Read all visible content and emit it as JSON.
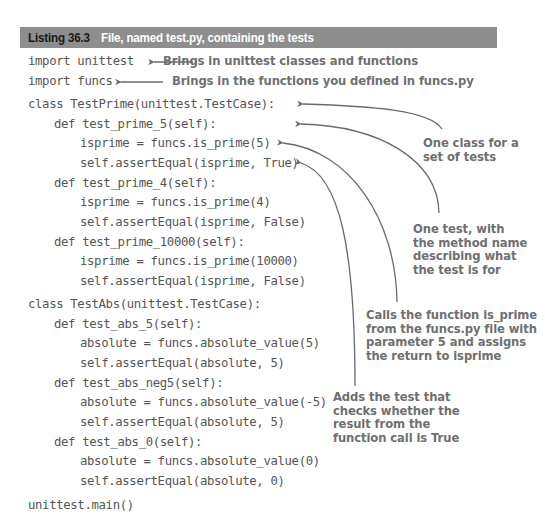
{
  "listing": {
    "number": "Listing 36.3",
    "title": "File, named test.py, containing the tests"
  },
  "code": {
    "lines": [
      {
        "indent": 0,
        "text": "import unittest"
      },
      {
        "indent": 0,
        "text": "import funcs"
      },
      {
        "indent": 0,
        "text": "class TestPrime(unittest.TestCase):"
      },
      {
        "indent": 1,
        "text": "def test_prime_5(self):"
      },
      {
        "indent": 2,
        "text": "isprime = funcs.is_prime(5)"
      },
      {
        "indent": 2,
        "text": "self.assertEqual(isprime, True)"
      },
      {
        "indent": 1,
        "text": "def test_prime_4(self):"
      },
      {
        "indent": 2,
        "text": "isprime = funcs.is_prime(4)"
      },
      {
        "indent": 2,
        "text": "self.assertEqual(isprime, False)"
      },
      {
        "indent": 1,
        "text": "def test_prime_10000(self):"
      },
      {
        "indent": 2,
        "text": "isprime = funcs.is_prime(10000)"
      },
      {
        "indent": 2,
        "text": "self.assertEqual(isprime, False)"
      },
      {
        "indent": 0,
        "text": "class TestAbs(unittest.TestCase):"
      },
      {
        "indent": 1,
        "text": "def test_abs_5(self):"
      },
      {
        "indent": 2,
        "text": "absolute = funcs.absolute_value(5)"
      },
      {
        "indent": 2,
        "text": "self.assertEqual(absolute, 5)"
      },
      {
        "indent": 1,
        "text": "def test_abs_neg5(self):"
      },
      {
        "indent": 2,
        "text": "absolute = funcs.absolute_value(-5)"
      },
      {
        "indent": 2,
        "text": "self.assertEqual(absolute, 5)"
      },
      {
        "indent": 1,
        "text": "def test_abs_0(self):"
      },
      {
        "indent": 2,
        "text": "absolute = funcs.absolute_value(0)"
      },
      {
        "indent": 2,
        "text": "self.assertEqual(absolute, 0)"
      },
      {
        "indent": 0,
        "text": "unittest.main()"
      }
    ]
  },
  "annotations": {
    "import_unittest": "Brings in unittest classes and functions",
    "import_funcs": "Brings in the functions you defined in funcs.py",
    "class_note": "One class for a\nset of tests",
    "test_note": "One test, with\nthe method name\ndescribing what\nthe test is for",
    "call_note": "Calls the function is_prime\nfrom the funcs.py file with\nparameter 5 and assigns\nthe return to isprime",
    "assert_note": "Adds the test that\nchecks whether the\nresult from the\nfunction call is True"
  },
  "colors": {
    "header_bg": "#8e8e8e",
    "header_number": "#1a1a1a",
    "header_title": "#ffffff",
    "code_text": "#555555",
    "annotation_text": "#6f6f6f",
    "arrow": "#6a6a6a"
  }
}
